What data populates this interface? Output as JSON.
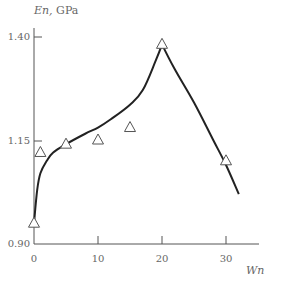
{
  "chart_data": {
    "type": "line",
    "title": "",
    "xlabel": "Wn",
    "ylabel": "En, GPa",
    "xlim": [
      0,
      35
    ],
    "ylim": [
      0.9,
      1.4
    ],
    "x_ticks": [
      0,
      10,
      20,
      30
    ],
    "x_tick_labels": [
      "0",
      "10",
      "20",
      "30"
    ],
    "y_ticks": [
      0.9,
      1.15,
      1.4
    ],
    "y_tick_labels": [
      "0.90",
      "1.15",
      "1.40"
    ],
    "grid": false,
    "legend": null,
    "series": [
      {
        "name": "measured",
        "style": "triangle-markers",
        "x": [
          0,
          1,
          5,
          10,
          15,
          20,
          30
        ],
        "y": [
          0.95,
          1.12,
          1.14,
          1.15,
          1.18,
          1.38,
          1.1
        ]
      },
      {
        "name": "fit",
        "style": "solid-line",
        "x": [
          0,
          0.5,
          1,
          2,
          3,
          5,
          8,
          10,
          12,
          15,
          17,
          19,
          20,
          22,
          25,
          28,
          30,
          32
        ],
        "y": [
          0.95,
          1.03,
          1.07,
          1.1,
          1.12,
          1.14,
          1.165,
          1.18,
          1.2,
          1.235,
          1.27,
          1.34,
          1.38,
          1.32,
          1.24,
          1.15,
          1.09,
          1.02
        ]
      }
    ]
  },
  "labels": {
    "ylabel_italic": "En,",
    "ylabel_unit": " GPa",
    "xlabel": "Wn",
    "y_tick_0": "0.90",
    "y_tick_1": "1.15",
    "y_tick_2": "1.40",
    "x_tick_0": "0",
    "x_tick_1": "10",
    "x_tick_2": "20",
    "x_tick_3": "30"
  }
}
